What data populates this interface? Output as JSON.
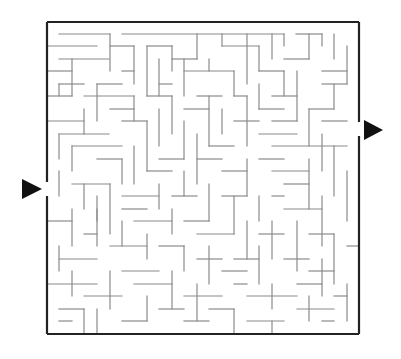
{
  "puzzle": {
    "title": "Maze",
    "grid": {
      "cols": 25,
      "rows": 25,
      "origin_x": 47,
      "origin_y": 22,
      "cell": 12.48
    },
    "colors": {
      "wall": "#8a8a8a",
      "border": "#222222",
      "arrow": "#111111",
      "background": "#ffffff"
    },
    "entry": {
      "side": "left",
      "label": "start-arrow",
      "arrow": [
        [
          22,
          179
        ],
        [
          42,
          189
        ],
        [
          22,
          199
        ]
      ],
      "gap_y": [
        182,
        196
      ]
    },
    "exit": {
      "side": "right",
      "label": "finish-arrow",
      "arrow": [
        [
          364,
          120
        ],
        [
          383,
          130
        ],
        [
          364,
          140
        ]
      ],
      "gap_y": [
        122,
        136
      ]
    },
    "walls": [
      [
        59,
        34,
        110,
        34
      ],
      [
        122,
        34,
        284,
        34
      ],
      [
        296,
        34,
        322,
        34
      ],
      [
        47,
        46,
        97,
        46
      ],
      [
        110,
        34,
        110,
        71
      ],
      [
        110,
        46,
        134,
        46
      ],
      [
        134,
        46,
        134,
        84
      ],
      [
        147,
        46,
        147,
        96
      ],
      [
        147,
        46,
        172,
        46
      ],
      [
        197,
        34,
        197,
        59
      ],
      [
        172,
        46,
        172,
        71
      ],
      [
        172,
        59,
        197,
        59
      ],
      [
        222,
        34,
        222,
        46
      ],
      [
        222,
        46,
        259,
        46
      ],
      [
        247,
        34,
        247,
        84
      ],
      [
        259,
        46,
        259,
        71
      ],
      [
        272,
        34,
        272,
        59
      ],
      [
        284,
        34,
        284,
        46
      ],
      [
        284,
        59,
        309,
        59
      ],
      [
        309,
        34,
        309,
        59
      ],
      [
        322,
        34,
        322,
        46
      ],
      [
        334,
        34,
        334,
        59
      ],
      [
        322,
        71,
        347,
        71
      ],
      [
        347,
        46,
        347,
        84
      ],
      [
        59,
        59,
        109,
        59
      ],
      [
        72,
        59,
        72,
        96
      ],
      [
        47,
        71,
        72,
        71
      ],
      [
        122,
        71,
        134,
        71
      ],
      [
        97,
        84,
        122,
        84
      ],
      [
        97,
        84,
        97,
        121
      ],
      [
        159,
        59,
        159,
        96
      ],
      [
        159,
        84,
        172,
        84
      ],
      [
        184,
        59,
        184,
        96
      ],
      [
        184,
        71,
        234,
        71
      ],
      [
        209,
        59,
        209,
        71
      ],
      [
        234,
        71,
        234,
        96
      ],
      [
        259,
        71,
        284,
        71
      ],
      [
        284,
        71,
        284,
        96
      ],
      [
        297,
        71,
        297,
        121
      ],
      [
        322,
        84,
        347,
        84
      ],
      [
        334,
        84,
        334,
        109
      ],
      [
        59,
        84,
        84,
        84
      ],
      [
        59,
        84,
        59,
        96
      ],
      [
        47,
        96,
        72,
        96
      ],
      [
        84,
        96,
        134,
        96
      ],
      [
        134,
        96,
        134,
        121
      ],
      [
        110,
        109,
        134,
        109
      ],
      [
        147,
        96,
        172,
        96
      ],
      [
        172,
        96,
        172,
        134
      ],
      [
        197,
        96,
        222,
        96
      ],
      [
        209,
        96,
        209,
        146
      ],
      [
        234,
        96,
        247,
        96
      ],
      [
        247,
        96,
        247,
        146
      ],
      [
        259,
        84,
        259,
        109
      ],
      [
        259,
        109,
        284,
        109
      ],
      [
        272,
        96,
        297,
        96
      ],
      [
        309,
        109,
        334,
        109
      ],
      [
        309,
        109,
        309,
        146
      ],
      [
        322,
        121,
        347,
        121
      ],
      [
        47,
        121,
        84,
        121
      ],
      [
        59,
        134,
        109,
        134
      ],
      [
        59,
        134,
        59,
        159
      ],
      [
        84,
        109,
        84,
        134
      ],
      [
        122,
        121,
        147,
        121
      ],
      [
        147,
        121,
        147,
        171
      ],
      [
        159,
        109,
        159,
        146
      ],
      [
        184,
        109,
        209,
        109
      ],
      [
        184,
        121,
        184,
        159
      ],
      [
        209,
        146,
        234,
        146
      ],
      [
        222,
        109,
        222,
        134
      ],
      [
        234,
        121,
        259,
        121
      ],
      [
        272,
        121,
        297,
        121
      ],
      [
        259,
        134,
        297,
        134
      ],
      [
        272,
        146,
        347,
        146
      ],
      [
        322,
        134,
        322,
        171
      ],
      [
        334,
        146,
        334,
        196
      ],
      [
        72,
        146,
        122,
        146
      ],
      [
        72,
        146,
        72,
        171
      ],
      [
        97,
        159,
        122,
        159
      ],
      [
        122,
        159,
        122,
        184
      ],
      [
        134,
        146,
        134,
        184
      ],
      [
        147,
        171,
        172,
        171
      ],
      [
        159,
        159,
        184,
        159
      ],
      [
        184,
        171,
        184,
        196
      ],
      [
        197,
        134,
        197,
        184
      ],
      [
        197,
        159,
        222,
        159
      ],
      [
        222,
        171,
        247,
        171
      ],
      [
        247,
        159,
        247,
        196
      ],
      [
        259,
        159,
        284,
        159
      ],
      [
        272,
        171,
        309,
        171
      ],
      [
        284,
        184,
        309,
        184
      ],
      [
        309,
        159,
        309,
        209
      ],
      [
        347,
        171,
        347,
        221
      ],
      [
        59,
        171,
        59,
        196
      ],
      [
        72,
        184,
        110,
        184
      ],
      [
        84,
        184,
        84,
        209
      ],
      [
        110,
        184,
        110,
        234
      ],
      [
        97,
        196,
        97,
        221
      ],
      [
        122,
        196,
        159,
        196
      ],
      [
        159,
        184,
        159,
        209
      ],
      [
        172,
        196,
        197,
        196
      ],
      [
        209,
        184,
        209,
        221
      ],
      [
        222,
        196,
        247,
        196
      ],
      [
        234,
        196,
        234,
        234
      ],
      [
        259,
        196,
        259,
        221
      ],
      [
        272,
        196,
        284,
        196
      ],
      [
        284,
        209,
        322,
        209
      ],
      [
        322,
        196,
        322,
        246
      ],
      [
        47,
        221,
        72,
        221
      ],
      [
        72,
        209,
        72,
        246
      ],
      [
        84,
        234,
        97,
        234
      ],
      [
        97,
        209,
        97,
        246
      ],
      [
        122,
        209,
        147,
        209
      ],
      [
        122,
        221,
        122,
        246
      ],
      [
        134,
        221,
        172,
        221
      ],
      [
        172,
        209,
        172,
        234
      ],
      [
        184,
        221,
        209,
        221
      ],
      [
        197,
        234,
        234,
        234
      ],
      [
        247,
        221,
        247,
        259
      ],
      [
        259,
        234,
        284,
        234
      ],
      [
        272,
        221,
        272,
        259
      ],
      [
        297,
        221,
        297,
        271
      ],
      [
        309,
        234,
        334,
        234
      ],
      [
        334,
        234,
        334,
        284
      ],
      [
        347,
        246,
        359,
        246
      ],
      [
        59,
        259,
        97,
        259
      ],
      [
        59,
        246,
        59,
        271
      ],
      [
        110,
        246,
        147,
        246
      ],
      [
        147,
        234,
        147,
        259
      ],
      [
        159,
        246,
        184,
        246
      ],
      [
        184,
        246,
        184,
        271
      ],
      [
        197,
        259,
        222,
        259
      ],
      [
        209,
        246,
        209,
        284
      ],
      [
        234,
        259,
        259,
        259
      ],
      [
        259,
        246,
        259,
        284
      ],
      [
        284,
        259,
        309,
        259
      ],
      [
        309,
        271,
        334,
        271
      ],
      [
        322,
        259,
        322,
        296
      ],
      [
        47,
        284,
        97,
        284
      ],
      [
        72,
        271,
        72,
        296
      ],
      [
        84,
        296,
        122,
        296
      ],
      [
        110,
        271,
        110,
        309
      ],
      [
        122,
        271,
        159,
        271
      ],
      [
        134,
        284,
        172,
        284
      ],
      [
        147,
        296,
        147,
        321
      ],
      [
        172,
        271,
        172,
        309
      ],
      [
        184,
        296,
        222,
        296
      ],
      [
        197,
        284,
        197,
        321
      ],
      [
        222,
        271,
        247,
        271
      ],
      [
        234,
        284,
        247,
        284
      ],
      [
        247,
        296,
        297,
        296
      ],
      [
        272,
        284,
        272,
        309
      ],
      [
        297,
        284,
        322,
        284
      ],
      [
        309,
        296,
        309,
        321
      ],
      [
        334,
        296,
        347,
        296
      ],
      [
        347,
        284,
        347,
        321
      ],
      [
        59,
        309,
        84,
        309
      ],
      [
        84,
        309,
        84,
        334
      ],
      [
        59,
        321,
        72,
        321
      ],
      [
        97,
        309,
        97,
        334
      ],
      [
        122,
        321,
        147,
        321
      ],
      [
        159,
        309,
        184,
        309
      ],
      [
        184,
        321,
        209,
        321
      ],
      [
        209,
        309,
        234,
        309
      ],
      [
        234,
        309,
        234,
        334
      ],
      [
        247,
        321,
        284,
        321
      ],
      [
        297,
        309,
        334,
        309
      ],
      [
        322,
        321,
        334,
        321
      ],
      [
        272,
        321,
        272,
        334
      ]
    ]
  }
}
